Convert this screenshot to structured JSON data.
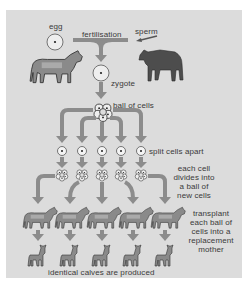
{
  "diagram": {
    "labels": {
      "egg": "egg",
      "sperm": "sperm",
      "fertilisation": "fertilisation",
      "zygote": "zygote",
      "ball_of_cells": "ball of cells",
      "split": "split cells apart",
      "divide": [
        "each cell",
        "divides into",
        "a ball of",
        "new cells"
      ],
      "transplant": [
        "transplant",
        "each ball of",
        "cells into a",
        "replacement",
        "mother"
      ],
      "result": "identical calves are produced"
    },
    "nodes": [
      {
        "id": "egg",
        "type": "cell",
        "label": "egg"
      },
      {
        "id": "sperm",
        "type": "cell",
        "label": "sperm"
      },
      {
        "id": "cow-parent",
        "type": "animal",
        "label": "cow"
      },
      {
        "id": "bull-parent",
        "type": "animal",
        "label": "bull"
      },
      {
        "id": "zygote",
        "type": "cell",
        "label": "zygote"
      },
      {
        "id": "ball-of-cells",
        "type": "embryo",
        "label": "ball of cells"
      },
      {
        "id": "split-cells",
        "type": "cell",
        "count": 5,
        "label": "split cells apart"
      },
      {
        "id": "new-balls",
        "type": "embryo",
        "count": 5,
        "label": "each cell divides into a ball of new cells"
      },
      {
        "id": "surrogate-mothers",
        "type": "animal",
        "count": 5,
        "label": "transplant each ball of cells into a replacement mother"
      },
      {
        "id": "calves",
        "type": "animal",
        "count": 5,
        "label": "identical calves are produced"
      }
    ],
    "edges": [
      {
        "from": "egg",
        "to": "zygote",
        "label": "fertilisation"
      },
      {
        "from": "sperm",
        "to": "zygote",
        "label": "fertilisation"
      },
      {
        "from": "zygote",
        "to": "ball-of-cells"
      },
      {
        "from": "ball-of-cells",
        "to": "split-cells"
      },
      {
        "from": "split-cells",
        "to": "new-balls"
      },
      {
        "from": "new-balls",
        "to": "surrogate-mothers"
      },
      {
        "from": "surrogate-mothers",
        "to": "calves"
      }
    ],
    "colors": {
      "background": "#dcdcdc",
      "arrow": "#8c8c8c",
      "text": "#3a3a3a",
      "cow": "#7a7a7a",
      "bull": "#4a4a4a"
    }
  }
}
